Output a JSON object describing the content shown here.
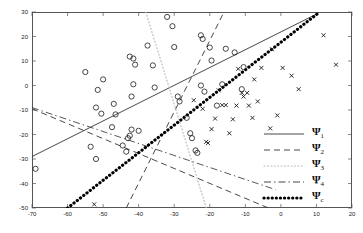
{
  "chart_data": {
    "type": "scatter",
    "title": "",
    "xlabel": "",
    "ylabel": "",
    "xlim": [
      -70,
      20
    ],
    "ylim": [
      -50,
      30
    ],
    "xticks": [
      -70,
      -60,
      -50,
      -40,
      -30,
      -20,
      -10,
      0,
      10,
      20
    ],
    "yticks": [
      -50,
      -40,
      -30,
      -20,
      -10,
      0,
      10,
      20,
      30
    ],
    "xtick_labels": [
      "-70",
      "-60",
      "-50",
      "-40",
      "-30",
      "-20",
      "-10",
      "0",
      "10",
      "20"
    ],
    "ytick_labels": [
      "-50",
      "-40",
      "-30",
      "-20",
      "-10",
      "0",
      "10",
      "20",
      "30"
    ],
    "grid": false,
    "legend_position": "right-bottom",
    "series": [
      {
        "name": "class-o",
        "marker": "circle",
        "color": "#1a1a1a",
        "points": [
          [
            -55.0,
            5.5
          ],
          [
            -51.5,
            -1.8
          ],
          [
            -50.0,
            2.5
          ],
          [
            -52.0,
            -9.0
          ],
          [
            -50.5,
            -11.5
          ],
          [
            -47.0,
            -7.5
          ],
          [
            -46.5,
            -11.8
          ],
          [
            -47.5,
            -17.0
          ],
          [
            -53.5,
            -25.0
          ],
          [
            -52.0,
            -30.0
          ],
          [
            -44.5,
            -24.5
          ],
          [
            -43.5,
            -27.0
          ],
          [
            -42.0,
            -4.5
          ],
          [
            -42.5,
            11.8
          ],
          [
            -41.5,
            11.0
          ],
          [
            -41.0,
            8.5
          ],
          [
            -41.5,
            0.5
          ],
          [
            -42.0,
            -18.0
          ],
          [
            -42.5,
            -20.5
          ],
          [
            -43.0,
            -21.5
          ],
          [
            -40.0,
            -18.5
          ],
          [
            -37.5,
            16.3
          ],
          [
            -36.0,
            8.2
          ],
          [
            -35.5,
            -0.8
          ],
          [
            -32.0,
            28.0
          ],
          [
            -30.5,
            24.2
          ],
          [
            -30.0,
            15.7
          ],
          [
            -29.0,
            -4.5
          ],
          [
            -28.5,
            -6.5
          ],
          [
            -26.5,
            -13.2
          ],
          [
            -25.5,
            -19.5
          ],
          [
            -25.0,
            -21.5
          ],
          [
            -24.0,
            -26.5
          ],
          [
            -23.5,
            -27.5
          ],
          [
            -22.5,
            20.5
          ],
          [
            -22.0,
            19.0
          ],
          [
            -22.5,
            0.0
          ],
          [
            -21.5,
            -2.5
          ],
          [
            -20.0,
            15.5
          ],
          [
            -19.5,
            10.2
          ],
          [
            -18.0,
            -8.2
          ],
          [
            -16.5,
            0.5
          ],
          [
            -15.5,
            15.0
          ],
          [
            -13.0,
            13.5
          ],
          [
            -10.5,
            7.5
          ],
          [
            -11.0,
            -1.5
          ],
          [
            -69.0,
            -34.0
          ]
        ]
      },
      {
        "name": "class-x",
        "marker": "cross",
        "color": "#1a1a1a",
        "points": [
          [
            -24.5,
            -6.0
          ],
          [
            -22.0,
            -9.5
          ],
          [
            -21.0,
            -23.0
          ],
          [
            -20.5,
            -23.5
          ],
          [
            -19.5,
            -17.8
          ],
          [
            -18.5,
            -13.5
          ],
          [
            -17.5,
            -2.0
          ],
          [
            -16.5,
            -8.0
          ],
          [
            -15.5,
            -8.0
          ],
          [
            -14.5,
            -19.5
          ],
          [
            -13.5,
            -13.8
          ],
          [
            -12.5,
            -8.2
          ],
          [
            -12.0,
            6.8
          ],
          [
            -11.0,
            -3.0
          ],
          [
            -10.5,
            -4.5
          ],
          [
            -9.5,
            -3.0
          ],
          [
            -9.0,
            -8.2
          ],
          [
            -8.0,
            -13.2
          ],
          [
            -7.5,
            2.5
          ],
          [
            -6.5,
            -6.5
          ],
          [
            -5.5,
            7.2
          ],
          [
            -3.0,
            -17.5
          ],
          [
            -2.5,
            14.8
          ],
          [
            -1.0,
            -12.2
          ],
          [
            0.5,
            7.2
          ],
          [
            3.0,
            4.0
          ],
          [
            5.0,
            -1.5
          ],
          [
            12.0,
            20.5
          ],
          [
            15.5,
            8.5
          ],
          [
            -52.5,
            -48.5
          ]
        ]
      }
    ],
    "lines": [
      {
        "name": "Psi1",
        "style": "solid",
        "from": [
          -70,
          -29.0
        ],
        "to": [
          10.5,
          29.5
        ],
        "width": 0.9,
        "color": "#333333"
      },
      {
        "name": "Psi2a",
        "style": "dashed",
        "from": [
          -70,
          -9.5
        ],
        "to": [
          -3.5,
          -50
        ],
        "width": 0.9,
        "color": "#333333"
      },
      {
        "name": "Psi2b",
        "style": "dashed",
        "from": [
          -43.5,
          -50
        ],
        "to": [
          -16.0,
          30
        ],
        "width": 0.9,
        "color": "#333333"
      },
      {
        "name": "Psi3",
        "style": "dotted",
        "from": [
          -38.0,
          30
        ],
        "to": [
          -21.0,
          -50
        ],
        "width": 1.2,
        "color": "#bbbbbb"
      },
      {
        "name": "Psi4",
        "style": "dashdot",
        "from": [
          -70,
          -9.0
        ],
        "to": [
          -1.5,
          -42.5
        ],
        "width": 0.9,
        "color": "#444444"
      },
      {
        "name": "PsiC",
        "style": "thickdot",
        "from": [
          -60.0,
          -50
        ],
        "to": [
          10.5,
          29.5
        ],
        "width": 3.2,
        "color": "#000000"
      }
    ],
    "legend": [
      {
        "label": "Ψ",
        "sub": "1",
        "hat": false,
        "style": "solid",
        "name": "Psi1"
      },
      {
        "label": "Ψ",
        "sub": "2",
        "hat": false,
        "style": "dashed",
        "name": "Psi2"
      },
      {
        "label": "Ψ",
        "sub": "3",
        "hat": false,
        "style": "dotted",
        "name": "Psi3"
      },
      {
        "label": "Ψ",
        "sub": "4",
        "hat": false,
        "style": "dashdot",
        "name": "Psi4"
      },
      {
        "label": "Ψ",
        "sub": "c",
        "hat": true,
        "style": "thickdot",
        "name": "PsiC"
      }
    ]
  }
}
